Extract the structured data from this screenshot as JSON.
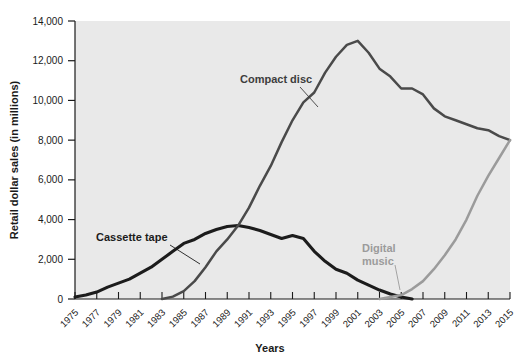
{
  "chart_data": {
    "type": "line",
    "title": "",
    "xlabel": "Years",
    "ylabel": "Retail dollar sales (in millions)",
    "xlim": [
      1975,
      2015
    ],
    "ylim": [
      0,
      14000
    ],
    "grid": false,
    "legend_position": "inline-labels",
    "y_ticks": [
      0,
      2000,
      4000,
      6000,
      8000,
      10000,
      12000,
      14000
    ],
    "y_tick_labels": [
      "0",
      "2,000",
      "4,000",
      "6,000",
      "8,000",
      "10,000",
      "12,000",
      "14,000"
    ],
    "x_ticks": [
      1975,
      1977,
      1979,
      1981,
      1983,
      1985,
      1987,
      1989,
      1991,
      1993,
      1995,
      1997,
      1999,
      2001,
      2003,
      2005,
      2007,
      2009,
      2011,
      2013,
      2015
    ],
    "x_tick_labels": [
      "1975",
      "1977",
      "1979",
      "1981",
      "1983",
      "1985",
      "1987",
      "1989",
      "1991",
      "1993",
      "1995",
      "1997",
      "1999",
      "2001",
      "2003",
      "2005",
      "2007",
      "2009",
      "2011",
      "2013",
      "2015"
    ],
    "x": [
      1975,
      1976,
      1977,
      1978,
      1979,
      1980,
      1981,
      1982,
      1983,
      1984,
      1985,
      1986,
      1987,
      1988,
      1989,
      1990,
      1991,
      1992,
      1993,
      1994,
      1995,
      1996,
      1997,
      1998,
      1999,
      2000,
      2001,
      2002,
      2003,
      2004,
      2005,
      2006,
      2007,
      2008,
      2009,
      2010,
      2011,
      2012,
      2013,
      2014,
      2015
    ],
    "series": [
      {
        "name": "Cassette tape",
        "color": "#1c1c1c",
        "values": [
          100,
          200,
          350,
          600,
          800,
          1000,
          1300,
          1600,
          2000,
          2400,
          2800,
          3000,
          3300,
          3500,
          3650,
          3700,
          3600,
          3450,
          3250,
          3050,
          3200,
          3050,
          2400,
          1900,
          1500,
          1300,
          950,
          700,
          450,
          250,
          100,
          0,
          0,
          0,
          0,
          0,
          0,
          0,
          0,
          0,
          0
        ]
      },
      {
        "name": "Compact disc",
        "color": "#4a4a4a",
        "values": [
          0,
          0,
          0,
          0,
          0,
          0,
          0,
          0,
          0,
          120,
          400,
          900,
          1600,
          2400,
          3000,
          3700,
          4600,
          5700,
          6700,
          7900,
          9000,
          9900,
          10400,
          11400,
          12200,
          12800,
          13000,
          12400,
          11600,
          11200,
          10600,
          10600,
          10300,
          9600,
          9200,
          9000,
          8800,
          8600,
          8500,
          8200,
          8000
        ]
      },
      {
        "name": "Digital music",
        "color": "#9b9b9b",
        "values": [
          0,
          0,
          0,
          0,
          0,
          0,
          0,
          0,
          0,
          0,
          0,
          0,
          0,
          0,
          0,
          0,
          0,
          0,
          0,
          0,
          0,
          0,
          0,
          0,
          0,
          0,
          0,
          0,
          0,
          100,
          200,
          500,
          900,
          1500,
          2200,
          3000,
          4000,
          5200,
          6200,
          7100,
          8000
        ]
      }
    ],
    "annotations": [
      {
        "text": "Cassette tape",
        "series": "Cassette tape",
        "color": "#1c1c1c",
        "lines": [
          "Cassette tape"
        ]
      },
      {
        "text": "Compact disc",
        "series": "Compact disc",
        "color": "#3d3d3d",
        "lines": [
          "Compact disc"
        ]
      },
      {
        "text": "Digital music",
        "series": "Digital music",
        "color": "#9b9b9b",
        "lines": [
          "Digital",
          "music"
        ]
      }
    ]
  }
}
